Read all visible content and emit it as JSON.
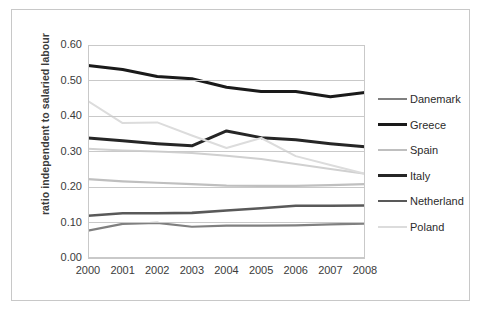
{
  "chart_data": {
    "type": "line",
    "title": "",
    "xlabel": "",
    "ylabel": "ratio independent to salaried labour",
    "x": [
      "2000",
      "2001",
      "2002",
      "2003",
      "2004",
      "2005",
      "2006",
      "2007",
      "2008"
    ],
    "categories": [
      "2000",
      "2001",
      "2002",
      "2003",
      "2004",
      "2005",
      "2006",
      "2007",
      "2008"
    ],
    "ylim": [
      0.0,
      0.6
    ],
    "yticks": [
      "0.00",
      "0.10",
      "0.20",
      "0.30",
      "0.40",
      "0.50",
      "0.60"
    ],
    "ytick_values": [
      0.0,
      0.1,
      0.2,
      0.3,
      0.4,
      0.5,
      0.6
    ],
    "grid": "horizontal",
    "legend_position": "right",
    "series": [
      {
        "name": "Danemark",
        "color": "#808080",
        "width": 2.2,
        "values": [
          0.077,
          0.096,
          0.099,
          0.088,
          0.091,
          0.091,
          0.092,
          0.095,
          0.097
        ]
      },
      {
        "name": "Greece",
        "color": "#1a1a1a",
        "width": 3.0,
        "values": [
          0.542,
          0.531,
          0.511,
          0.505,
          0.481,
          0.469,
          0.469,
          0.454,
          0.466
        ]
      },
      {
        "name": "Spain",
        "color": "#bfbfbf",
        "width": 2.2,
        "values": [
          0.222,
          0.216,
          0.212,
          0.208,
          0.204,
          0.203,
          0.203,
          0.205,
          0.208
        ]
      },
      {
        "name": "Italy",
        "color": "#262626",
        "width": 3.0,
        "values": [
          0.338,
          0.33,
          0.322,
          0.316,
          0.358,
          0.339,
          0.333,
          0.322,
          0.313
        ]
      },
      {
        "name": "Netherland",
        "color": "#595959",
        "width": 2.6,
        "values": [
          0.119,
          0.126,
          0.126,
          0.127,
          0.134,
          0.14,
          0.147,
          0.147,
          0.148
        ]
      },
      {
        "name": "Poland",
        "color": "#dcdcdc",
        "width": 2.0,
        "values": [
          0.442,
          0.38,
          0.382,
          0.345,
          0.31,
          0.338,
          0.287,
          0.262,
          0.237
        ]
      }
    ],
    "overlay_series": [
      {
        "name": "Spain",
        "note": "second light band visible near 0.31 at 2000 descending to 0.24 at 2008",
        "color": "#d0d0d0",
        "width": 2.0,
        "values": [
          0.308,
          0.303,
          0.3,
          0.296,
          0.288,
          0.279,
          0.265,
          0.251,
          0.237
        ]
      }
    ]
  },
  "legend": {
    "items": [
      {
        "label": "Danemark"
      },
      {
        "label": "Greece"
      },
      {
        "label": "Spain"
      },
      {
        "label": "Italy"
      },
      {
        "label": "Netherland"
      },
      {
        "label": "Poland"
      }
    ]
  }
}
